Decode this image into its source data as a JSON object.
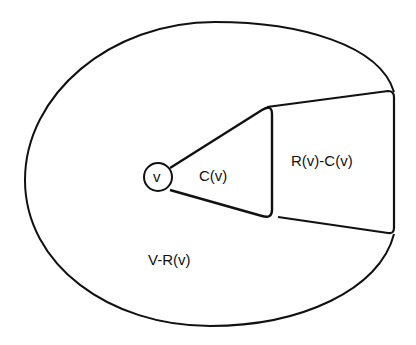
{
  "diagram": {
    "type": "set-region diagram",
    "labels": {
      "vertex": "v",
      "cone": "C(v)",
      "reachable_minus_cone": "R(v)-C(v)",
      "complement": "V-R(v)"
    },
    "colors": {
      "stroke": "#111111",
      "background": "#ffffff"
    }
  }
}
